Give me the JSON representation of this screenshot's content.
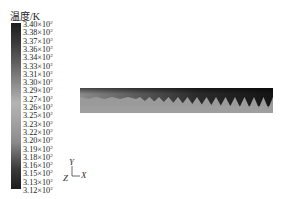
{
  "figure": {
    "faint_header": "",
    "legend": {
      "title": "温度/K",
      "ticks": [
        {
          "mantissa": "3.40",
          "exp": "2"
        },
        {
          "mantissa": "3.38",
          "exp": "2"
        },
        {
          "mantissa": "3.37",
          "exp": "2"
        },
        {
          "mantissa": "3.36",
          "exp": "2"
        },
        {
          "mantissa": "3.34",
          "exp": "2"
        },
        {
          "mantissa": "3.33",
          "exp": "2"
        },
        {
          "mantissa": "3.31",
          "exp": "2"
        },
        {
          "mantissa": "3.30",
          "exp": "2"
        },
        {
          "mantissa": "3.29",
          "exp": "2"
        },
        {
          "mantissa": "3.27",
          "exp": "2"
        },
        {
          "mantissa": "3.26",
          "exp": "2"
        },
        {
          "mantissa": "3.25",
          "exp": "2"
        },
        {
          "mantissa": "3.23",
          "exp": "2"
        },
        {
          "mantissa": "3.22",
          "exp": "2"
        },
        {
          "mantissa": "3.20",
          "exp": "2"
        },
        {
          "mantissa": "3.19",
          "exp": "2"
        },
        {
          "mantissa": "3.18",
          "exp": "2"
        },
        {
          "mantissa": "3.16",
          "exp": "2"
        },
        {
          "mantissa": "3.15",
          "exp": "2"
        },
        {
          "mantissa": "3.13",
          "exp": "2"
        },
        {
          "mantissa": "3.12",
          "exp": "2"
        }
      ],
      "times_sign": "×10"
    },
    "axes_triad": {
      "y": "Y",
      "x": "X",
      "z": "Z"
    },
    "contour": {
      "description": "temperature contour of a channel strip with sawtooth interface",
      "dark_color": "#1e1e1e",
      "light_color": "#9a9a9a",
      "teeth_count": 14
    }
  }
}
